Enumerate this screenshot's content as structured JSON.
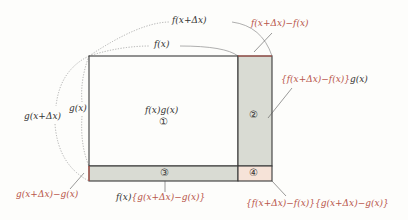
{
  "diagram": {
    "colors": {
      "outline": "#3a3a3a",
      "shade_gray": "#d9dbd3",
      "shade_pink": "#f6e3d8",
      "accent_red": "#b8554a",
      "dotted": "#9a9a9a",
      "background": "#fdfdfb"
    },
    "top_labels": {
      "f_x_plus_dx": "f(x+Δx)",
      "f_x": "f(x)",
      "delta_f": "f(x+Δx)−f(x)"
    },
    "left_labels": {
      "g_x": "g(x)",
      "g_x_plus_dx": "g(x+Δx)",
      "delta_g": "g(x+Δx)−g(x)"
    },
    "regions": [
      {
        "id": "1",
        "marker": "①",
        "area_label": "f(x)g(x)"
      },
      {
        "id": "2",
        "marker": "②",
        "area_label_red": "{f(x+Δx)−f(x)}",
        "area_label_black": "g(x)"
      },
      {
        "id": "3",
        "marker": "③",
        "area_label_black": "f(x)",
        "area_label_red": "{g(x+Δx)−g(x)}"
      },
      {
        "id": "4",
        "marker": "④",
        "area_label_red": "{f(x+Δx)−f(x)}{g(x+Δx)−g(x)}"
      }
    ]
  }
}
